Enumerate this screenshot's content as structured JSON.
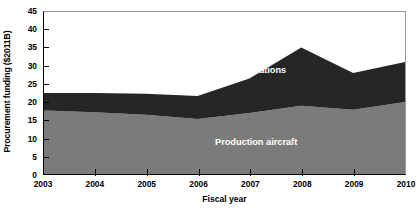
{
  "chart_data": {
    "type": "area",
    "stacked": true,
    "title": "",
    "xlabel": "Fiscal year",
    "ylabel": "Procurement funding ($2011B)",
    "x": [
      2003,
      2004,
      2005,
      2006,
      2007,
      2008,
      2009,
      2010
    ],
    "categories": [
      "2003",
      "2004",
      "2005",
      "2006",
      "2007",
      "2008",
      "2009",
      "2010"
    ],
    "series": [
      {
        "name": "Production aircraft",
        "color": "#7b7b7b",
        "values": [
          17.7,
          17.2,
          16.5,
          15.4,
          17.0,
          19.0,
          17.9,
          20.0
        ]
      },
      {
        "name": "Modifications",
        "color": "#262626",
        "values": [
          4.8,
          5.3,
          5.8,
          6.3,
          9.5,
          16.0,
          10.1,
          11.0
        ]
      }
    ],
    "cumulative_totals": [
      22.5,
      22.5,
      22.3,
      21.7,
      26.5,
      35.0,
      28.0,
      31.0
    ],
    "ylim": [
      0,
      45
    ],
    "xlim": [
      2003,
      2010
    ],
    "yticks": [
      0,
      5,
      10,
      15,
      20,
      25,
      30,
      35,
      40,
      45
    ],
    "ytick_labels": [
      "0",
      "5",
      "10",
      "15",
      "20",
      "25",
      "30",
      "35",
      "40",
      "45"
    ],
    "xtick_labels": [
      "2003",
      "2004",
      "2005",
      "2006",
      "2007",
      "2008",
      "2009",
      "2010"
    ],
    "grid": false,
    "legend": "inline-area-labels",
    "annotations": [
      {
        "text": "Modifications",
        "series": "Modifications"
      },
      {
        "text": "Production aircraft",
        "series": "Production aircraft"
      }
    ]
  },
  "axes": {
    "y_title": "Procurement funding ($2011B)",
    "x_title": "Fiscal year"
  },
  "labels": {
    "modifications": "Modifications",
    "production_aircraft": "Production aircraft"
  },
  "colors": {
    "production_aircraft": "#7b7b7b",
    "modifications": "#262626",
    "axis": "#000000",
    "plot_background": "#ffffff",
    "annotation_text": "#ffffff"
  }
}
